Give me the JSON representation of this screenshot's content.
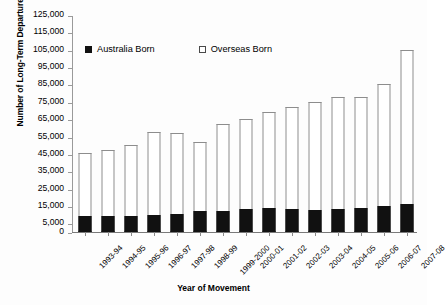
{
  "chart_data": {
    "type": "bar",
    "subtype": "stacked-vertical",
    "title": "",
    "xlabel": "Year of Movement",
    "ylabel": "Number of Long-Term Departures",
    "categories": [
      "1993-94",
      "1994-95",
      "1995-96",
      "1996-97",
      "1997-98",
      "1998-99",
      "1999-2000",
      "2000-01",
      "2001-02",
      "2002-03",
      "2003-04",
      "2004-05",
      "2005-06",
      "2006-07",
      "2007-08"
    ],
    "series": [
      {
        "name": "Australia Born",
        "color": "#111111",
        "values": [
          9000,
          9500,
          9500,
          10000,
          10500,
          12000,
          12000,
          13500,
          14000,
          13000,
          12500,
          13000,
          14000,
          15000,
          16000
        ]
      },
      {
        "name": "Overseas Born",
        "color": "#ffffff",
        "values": [
          36500,
          38000,
          40500,
          47500,
          46500,
          40000,
          50500,
          51500,
          55000,
          59000,
          62500,
          65000,
          64000,
          70000,
          89000
        ]
      }
    ],
    "totals": [
      45500,
      47500,
      50000,
      57500,
      57000,
      52000,
      62500,
      65000,
      69000,
      72000,
      75000,
      78000,
      78000,
      85000,
      105000
    ],
    "ylim": [
      0,
      125000
    ],
    "ytick_values": [
      0,
      5000,
      15000,
      25000,
      35000,
      45000,
      55000,
      65000,
      75000,
      85000,
      95000,
      105000,
      115000,
      125000
    ],
    "ytick_labels": [
      "0",
      "5,000",
      "15,000",
      "25,000",
      "35,000",
      "45,000",
      "55,000",
      "65,000",
      "75,000",
      "85,000",
      "95,000",
      "105,000",
      "115,000",
      "125,000"
    ],
    "grid": false,
    "legend_position": "top-inside",
    "legend": [
      {
        "label": "Australia  Born",
        "swatch": "filled-square"
      },
      {
        "label": "Overseas Born",
        "swatch": "hollow-square"
      }
    ]
  }
}
